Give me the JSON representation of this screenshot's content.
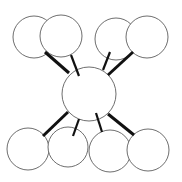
{
  "diagram": {
    "type": "hub-and-spoke",
    "colors": {
      "background": "#ffffff",
      "node_fill": "#ffffff",
      "node_stroke": "#6e6e6e",
      "edge": "#111111"
    },
    "hub": {
      "id": "center"
    },
    "nodes": [
      {
        "id": "top-left-back",
        "group": "top"
      },
      {
        "id": "top-left-front",
        "group": "top"
      },
      {
        "id": "top-right-back",
        "group": "top"
      },
      {
        "id": "top-right-front",
        "group": "top"
      },
      {
        "id": "bottom-1",
        "group": "bottom"
      },
      {
        "id": "bottom-2",
        "group": "bottom"
      },
      {
        "id": "bottom-3",
        "group": "bottom"
      },
      {
        "id": "bottom-4",
        "group": "bottom"
      }
    ],
    "edges": [
      {
        "from": "center",
        "to": "top-left-back",
        "weight": "thick"
      },
      {
        "from": "center",
        "to": "top-left-front",
        "weight": "thin"
      },
      {
        "from": "center",
        "to": "top-right-back",
        "weight": "thin"
      },
      {
        "from": "center",
        "to": "top-right-front",
        "weight": "thick"
      },
      {
        "from": "center",
        "to": "bottom-1",
        "weight": "thick"
      },
      {
        "from": "center",
        "to": "bottom-2",
        "weight": "thin"
      },
      {
        "from": "center",
        "to": "bottom-3",
        "weight": "thin"
      },
      {
        "from": "center",
        "to": "bottom-4",
        "weight": "thick"
      }
    ]
  }
}
